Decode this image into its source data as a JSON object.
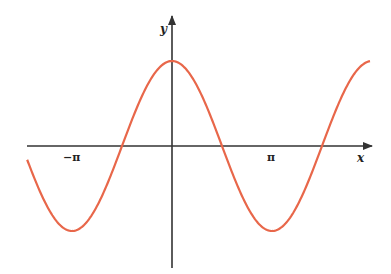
{
  "chart_data": {
    "type": "line",
    "title": "",
    "xlabel": "x",
    "ylabel": "y",
    "function": "y = cos(x)",
    "x_ticks": [
      {
        "value": -3.14159,
        "label": "−π"
      },
      {
        "value": 3.14159,
        "label": "π"
      }
    ],
    "xlim": [
      -4.55,
      6.25
    ],
    "ylim": [
      -1,
      1
    ],
    "grid": false,
    "legend": null,
    "series": [
      {
        "name": "cos(x)",
        "color": "#e8674a",
        "x": [
          -4.55,
          -3.14159,
          -1.5708,
          0,
          1.5708,
          3.14159,
          4.71239,
          6.22
        ],
        "values": [
          -0.16,
          -1,
          0,
          1,
          0,
          -1,
          0,
          1
        ]
      }
    ]
  },
  "colors": {
    "curve": "#e8674a",
    "axis": "#333333"
  }
}
